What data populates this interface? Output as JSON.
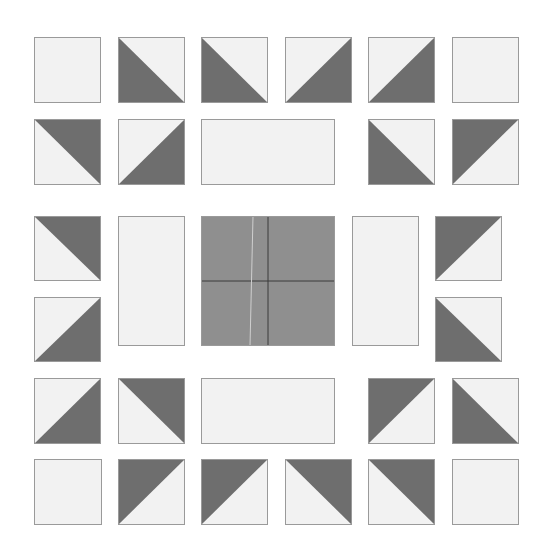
{
  "colors": {
    "light": "#f2f2f2",
    "dark": "#6e6e6e",
    "center": "#8f8f8f",
    "outline": "#9a9a9a",
    "seam": "#3a3a3a",
    "seam_light": "#cfcfcf",
    "background": "#ffffff"
  },
  "pieces": [
    {
      "id": "r1c1",
      "type": "square",
      "x": 34,
      "y": 37,
      "w": 67,
      "h": 66
    },
    {
      "id": "r1c2",
      "type": "hst",
      "dark": "bl",
      "x": 118,
      "y": 37,
      "w": 67,
      "h": 66
    },
    {
      "id": "r1c3",
      "type": "hst",
      "dark": "bl",
      "x": 201,
      "y": 37,
      "w": 67,
      "h": 66
    },
    {
      "id": "r1c4",
      "type": "hst",
      "dark": "br",
      "x": 285,
      "y": 37,
      "w": 67,
      "h": 66
    },
    {
      "id": "r1c5",
      "type": "hst",
      "dark": "br",
      "x": 368,
      "y": 37,
      "w": 67,
      "h": 66
    },
    {
      "id": "r1c6",
      "type": "square",
      "x": 452,
      "y": 37,
      "w": 67,
      "h": 66
    },
    {
      "id": "r2c1",
      "type": "hst",
      "dark": "tr",
      "x": 34,
      "y": 119,
      "w": 67,
      "h": 66
    },
    {
      "id": "r2c2",
      "type": "hst",
      "dark": "br",
      "x": 118,
      "y": 119,
      "w": 67,
      "h": 66
    },
    {
      "id": "r2rect",
      "type": "rect",
      "x": 201,
      "y": 119,
      "w": 134,
      "h": 66
    },
    {
      "id": "r2c5",
      "type": "hst",
      "dark": "bl",
      "x": 368,
      "y": 119,
      "w": 67,
      "h": 66
    },
    {
      "id": "r2c6",
      "type": "hst",
      "dark": "tl",
      "x": 452,
      "y": 119,
      "w": 67,
      "h": 66
    },
    {
      "id": "r3c1",
      "type": "hst",
      "dark": "tr",
      "x": 34,
      "y": 216,
      "w": 67,
      "h": 65
    },
    {
      "id": "r4c1",
      "type": "hst",
      "dark": "br",
      "x": 34,
      "y": 297,
      "w": 67,
      "h": 65
    },
    {
      "id": "leftrect",
      "type": "rect",
      "x": 118,
      "y": 216,
      "w": 67,
      "h": 130
    },
    {
      "id": "center",
      "type": "center",
      "x": 201,
      "y": 216,
      "w": 134,
      "h": 130
    },
    {
      "id": "rightrect",
      "type": "rect",
      "x": 352,
      "y": 216,
      "w": 67,
      "h": 130
    },
    {
      "id": "r3c6",
      "type": "hst",
      "dark": "tl",
      "x": 435,
      "y": 216,
      "w": 67,
      "h": 65
    },
    {
      "id": "r4c6",
      "type": "hst",
      "dark": "bl",
      "x": 435,
      "y": 297,
      "w": 67,
      "h": 65
    },
    {
      "id": "r5c1",
      "type": "hst",
      "dark": "br",
      "x": 34,
      "y": 378,
      "w": 67,
      "h": 66
    },
    {
      "id": "r5c2",
      "type": "hst",
      "dark": "tr",
      "x": 118,
      "y": 378,
      "w": 67,
      "h": 66
    },
    {
      "id": "r5rect",
      "type": "rect",
      "x": 201,
      "y": 378,
      "w": 134,
      "h": 66
    },
    {
      "id": "r5c5",
      "type": "hst",
      "dark": "tl",
      "x": 368,
      "y": 378,
      "w": 67,
      "h": 66
    },
    {
      "id": "r5c6",
      "type": "hst",
      "dark": "bl",
      "x": 452,
      "y": 378,
      "w": 67,
      "h": 66
    },
    {
      "id": "r6c1",
      "type": "square",
      "x": 34,
      "y": 459,
      "w": 68,
      "h": 66
    },
    {
      "id": "r6c2",
      "type": "hst",
      "dark": "tl",
      "x": 118,
      "y": 459,
      "w": 67,
      "h": 66
    },
    {
      "id": "r6c3",
      "type": "hst",
      "dark": "tl",
      "x": 201,
      "y": 459,
      "w": 67,
      "h": 66
    },
    {
      "id": "r6c4",
      "type": "hst",
      "dark": "tr",
      "x": 285,
      "y": 459,
      "w": 67,
      "h": 66
    },
    {
      "id": "r6c5",
      "type": "hst",
      "dark": "tr",
      "x": 368,
      "y": 459,
      "w": 67,
      "h": 66
    },
    {
      "id": "r6c6",
      "type": "square",
      "x": 452,
      "y": 459,
      "w": 67,
      "h": 66
    }
  ]
}
